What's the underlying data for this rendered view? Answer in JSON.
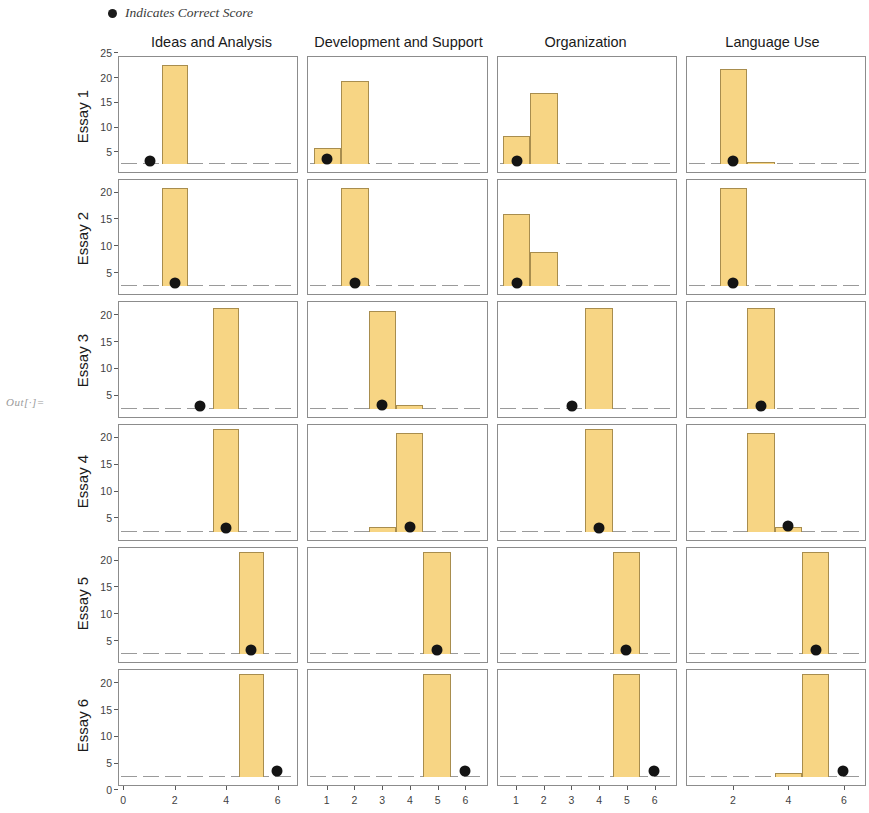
{
  "output_label": "Out[·]=",
  "legend": {
    "marker": "filled-circle",
    "text": "Indicates Correct Score",
    "marker_color": "#1b1b1b"
  },
  "style": {
    "bar_fill": "#F7D584",
    "bar_edge": "#A88D4E",
    "dot_color": "#141414",
    "frame_color": "#8c8c8c"
  },
  "columns": [
    "Ideas and Analysis",
    "Development and Support",
    "Organization",
    "Language Use"
  ],
  "rows": [
    "Essay 1",
    "Essay 2",
    "Essay 3",
    "Essay 4",
    "Essay 5",
    "Essay 6"
  ],
  "chart_data": {
    "type": "bar",
    "title": "",
    "subtitle": "",
    "xlabel": "",
    "ylabel": "",
    "grid": false,
    "legend_position": "top-left",
    "layout": "facet-grid",
    "facet_rows": [
      "Essay 1",
      "Essay 2",
      "Essay 3",
      "Essay 4",
      "Essay 5",
      "Essay 6"
    ],
    "facet_columns": [
      "Ideas and Analysis",
      "Development and Support",
      "Organization",
      "Language Use"
    ],
    "annotation": "Black dot indicates correct score",
    "row_axes": [
      {
        "ylim": [
          0,
          26
        ],
        "yticks": [
          5,
          10,
          15,
          20,
          25
        ]
      },
      {
        "ylim": [
          0,
          24
        ],
        "yticks": [
          5,
          10,
          15,
          20
        ]
      },
      {
        "ylim": [
          0,
          24
        ],
        "yticks": [
          5,
          10,
          15,
          20
        ]
      },
      {
        "ylim": [
          0,
          24
        ],
        "yticks": [
          5,
          10,
          15,
          20
        ]
      },
      {
        "ylim": [
          0,
          24
        ],
        "yticks": [
          5,
          10,
          15,
          20
        ]
      },
      {
        "ylim": [
          0,
          24
        ],
        "yticks": [
          0,
          5,
          10,
          15,
          20
        ]
      }
    ],
    "column_axes": [
      {
        "xlim": [
          -0.2,
          6.8
        ],
        "xticks": [
          0,
          2,
          4,
          6
        ]
      },
      {
        "xlim": [
          0.3,
          6.8
        ],
        "xticks": [
          1,
          2,
          3,
          4,
          5,
          6
        ]
      },
      {
        "xlim": [
          0.3,
          6.8
        ],
        "xticks": [
          1,
          2,
          3,
          4,
          5,
          6
        ]
      },
      {
        "xlim": [
          0.3,
          6.8
        ],
        "xticks": [
          2,
          4,
          6
        ]
      }
    ],
    "panels": [
      {
        "row": "Essay 1",
        "column": "Ideas and Analysis",
        "bars": [
          {
            "x": 2,
            "value": 25
          }
        ],
        "correct_score": {
          "x": 1,
          "y": 0.6
        }
      },
      {
        "row": "Essay 1",
        "column": "Development and Support",
        "bars": [
          {
            "x": 1,
            "value": 4
          },
          {
            "x": 2,
            "value": 21
          }
        ],
        "correct_score": {
          "x": 1,
          "y": 1.2
        }
      },
      {
        "row": "Essay 1",
        "column": "Organization",
        "bars": [
          {
            "x": 1,
            "value": 7
          },
          {
            "x": 2,
            "value": 18
          }
        ],
        "correct_score": {
          "x": 1,
          "y": 0.8
        }
      },
      {
        "row": "Essay 1",
        "column": "Language Use",
        "bars": [
          {
            "x": 2,
            "value": 24
          },
          {
            "x": 3,
            "value": 0.5
          }
        ],
        "correct_score": {
          "x": 2,
          "y": 0.8
        }
      },
      {
        "row": "Essay 2",
        "column": "Ideas and Analysis",
        "bars": [
          {
            "x": 2,
            "value": 23
          }
        ],
        "correct_score": {
          "x": 2,
          "y": 0.8
        }
      },
      {
        "row": "Essay 2",
        "column": "Development and Support",
        "bars": [
          {
            "x": 2,
            "value": 23
          }
        ],
        "correct_score": {
          "x": 2,
          "y": 0.8
        }
      },
      {
        "row": "Essay 2",
        "column": "Organization",
        "bars": [
          {
            "x": 1,
            "value": 17
          },
          {
            "x": 2,
            "value": 8
          }
        ],
        "correct_score": {
          "x": 1,
          "y": 0.8
        }
      },
      {
        "row": "Essay 2",
        "column": "Language Use",
        "bars": [
          {
            "x": 2,
            "value": 23
          }
        ],
        "correct_score": {
          "x": 2,
          "y": 0.8
        }
      },
      {
        "row": "Essay 3",
        "column": "Ideas and Analysis",
        "bars": [
          {
            "x": 4,
            "value": 23.5
          }
        ],
        "correct_score": {
          "x": 3,
          "y": 0.8
        }
      },
      {
        "row": "Essay 3",
        "column": "Development and Support",
        "bars": [
          {
            "x": 3,
            "value": 23
          },
          {
            "x": 4,
            "value": 1
          }
        ],
        "correct_score": {
          "x": 3,
          "y": 0.9
        }
      },
      {
        "row": "Essay 3",
        "column": "Organization",
        "bars": [
          {
            "x": 4,
            "value": 23.5
          }
        ],
        "correct_score": {
          "x": 3,
          "y": 0.8
        }
      },
      {
        "row": "Essay 3",
        "column": "Language Use",
        "bars": [
          {
            "x": 3,
            "value": 23.5
          }
        ],
        "correct_score": {
          "x": 3,
          "y": 0.8
        }
      },
      {
        "row": "Essay 4",
        "column": "Ideas and Analysis",
        "bars": [
          {
            "x": 4,
            "value": 24
          }
        ],
        "correct_score": {
          "x": 4,
          "y": 0.9
        }
      },
      {
        "row": "Essay 4",
        "column": "Development and Support",
        "bars": [
          {
            "x": 3,
            "value": 1
          },
          {
            "x": 4,
            "value": 23
          }
        ],
        "correct_score": {
          "x": 4,
          "y": 1.0
        }
      },
      {
        "row": "Essay 4",
        "column": "Organization",
        "bars": [
          {
            "x": 4,
            "value": 24
          }
        ],
        "correct_score": {
          "x": 4,
          "y": 0.9
        }
      },
      {
        "row": "Essay 4",
        "column": "Language Use",
        "bars": [
          {
            "x": 3,
            "value": 23
          },
          {
            "x": 4,
            "value": 1
          }
        ],
        "correct_score": {
          "x": 4,
          "y": 1.4
        }
      },
      {
        "row": "Essay 5",
        "column": "Ideas and Analysis",
        "bars": [
          {
            "x": 5,
            "value": 24
          }
        ],
        "correct_score": {
          "x": 5,
          "y": 0.9
        }
      },
      {
        "row": "Essay 5",
        "column": "Development and Support",
        "bars": [
          {
            "x": 5,
            "value": 24
          }
        ],
        "correct_score": {
          "x": 5,
          "y": 0.9
        }
      },
      {
        "row": "Essay 5",
        "column": "Organization",
        "bars": [
          {
            "x": 5,
            "value": 24
          }
        ],
        "correct_score": {
          "x": 5,
          "y": 0.9
        }
      },
      {
        "row": "Essay 5",
        "column": "Language Use",
        "bars": [
          {
            "x": 5,
            "value": 24
          }
        ],
        "correct_score": {
          "x": 5,
          "y": 0.9
        }
      },
      {
        "row": "Essay 6",
        "column": "Ideas and Analysis",
        "bars": [
          {
            "x": 5,
            "value": 24
          }
        ],
        "correct_score": {
          "x": 6,
          "y": 1.5
        }
      },
      {
        "row": "Essay 6",
        "column": "Development and Support",
        "bars": [
          {
            "x": 5,
            "value": 24
          }
        ],
        "correct_score": {
          "x": 6,
          "y": 1.5
        }
      },
      {
        "row": "Essay 6",
        "column": "Organization",
        "bars": [
          {
            "x": 5,
            "value": 24
          }
        ],
        "correct_score": {
          "x": 6,
          "y": 1.5
        }
      },
      {
        "row": "Essay 6",
        "column": "Language Use",
        "bars": [
          {
            "x": 4,
            "value": 1
          },
          {
            "x": 5,
            "value": 24
          }
        ],
        "correct_score": {
          "x": 6,
          "y": 1.5
        }
      }
    ]
  }
}
